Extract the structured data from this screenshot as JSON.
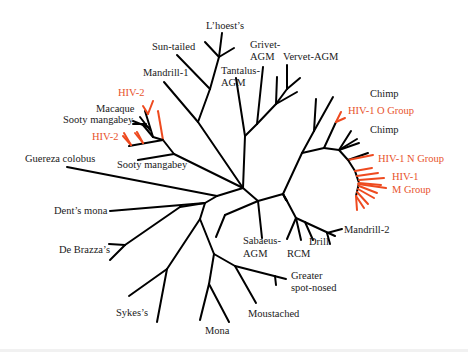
{
  "figure": {
    "type": "unrooted phylogenetic tree",
    "colors": {
      "primate_branch": "#000000",
      "hiv_branch": "#ee4a1f",
      "primate_label": "#1a1a1a",
      "hiv_label": "#e8532c"
    },
    "labels": {
      "lhoests": "L’hoest’s",
      "sun_tailed": "Sun-tailed",
      "grivet_agm_1": "Grivet-",
      "grivet_agm_2": "AGM",
      "vervet_agm": "Vervet-AGM",
      "tantalus_agm_1": "Tantalus-",
      "tantalus_agm_2": "AGM",
      "mandrill_1": "Mandrill-1",
      "hiv2_top": "HIV-2",
      "macaque": "Macaque",
      "sooty_mangabey_1": "Sooty mangabey",
      "hiv2_bottom": "HIV-2",
      "sooty_mangabey_2": "Sooty mangabey",
      "guereza_colobus": "Guereza colobus",
      "chimp_1": "Chimp",
      "hiv1_o_group": "HIV-1 O Group",
      "chimp_2": "Chimp",
      "hiv1_n_group": "HIV-1 N Group",
      "hiv1_m_group_1": "HIV-1",
      "hiv1_m_group_2": "M Group",
      "mandrill_2": "Mandrill-2",
      "drill": "Drill",
      "rcm": "RCM",
      "sabaeus_agm_1": "Sabaeus-",
      "sabaeus_agm_2": "AGM",
      "dents_mona": "Dent’s mona",
      "de_brazzas": "De Brazza’s",
      "greater_spot_nosed_1": "Greater",
      "greater_spot_nosed_2": "spot-nosed",
      "sykes": "Sykes’s",
      "moustached": "Moustached",
      "mona": "Mona"
    }
  }
}
